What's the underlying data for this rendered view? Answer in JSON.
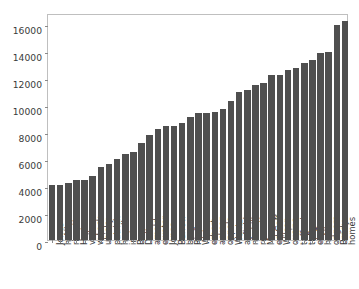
{
  "figure": {
    "background_color": "#ffffff",
    "axes_edge_color": "#bfbfbf",
    "bar_color": "#4f4f4f",
    "tick_color": "#3a3a3a"
  },
  "chart_data": {
    "type": "bar",
    "title": "",
    "xlabel": "",
    "ylabel": "",
    "ylim": [
      0,
      16800
    ],
    "yticks": [
      0,
      2000,
      4000,
      6000,
      8000,
      10000,
      12000,
      14000,
      16000
    ],
    "ytick_labels": [
      "0",
      "2000",
      "4000",
      "6000",
      "8000",
      "10000",
      "12000",
      "14000",
      "16000"
    ],
    "grid": false,
    "legend": false,
    "xtick_rotation": 90,
    "categories": [
      "Daniel Jones",
      "Josh Allen",
      "Jacoby Brissett",
      "Jalen Hurts",
      "Tua Tagovailoa",
      "Drew Lock",
      "Mitchell Trubisky",
      "Ryan Fitzpatrick",
      "Gardner Minshew II",
      "Jameis Winston",
      "Drew Brees",
      "Andy Dalton",
      "Sam Darnold",
      "Teddy Bridgewater",
      "Mac Jones",
      "Joe Burrow",
      "Ben Roethlisberger",
      "Philip Rivers",
      "Deshaun Watson",
      "Justin Herbert",
      "Lamar Jackson",
      "Jimmy Garoppolo",
      "Carson Wentz",
      "Baker Mayfield",
      "Ryan Tannehill",
      "Dak Prescott",
      "Kyler Murray",
      "Jared Goff",
      "Russell Wilson",
      "Kirk Cousins",
      "Matthew Stafford",
      "Matt Ryan",
      "Derek Carr",
      "Josh Allen",
      "Aaron Rodgers",
      "Tom Brady",
      "Patrick Mahomes"
    ],
    "xtick_labels": [
      "Jones",
      "h Allen",
      "rissett",
      "Hurts",
      "vailoa",
      "w Lock",
      "ubisky",
      "patrick",
      "hew II",
      "inston",
      "Brees",
      "Dalton",
      "arnold",
      "ewater",
      "Jones",
      "Burrow",
      "berger",
      "Rivers",
      "Watson",
      "erbert",
      "ackson",
      "oppolo",
      "Wentz",
      "ayfield",
      "nnehill",
      "rescott",
      "Murray",
      "ed Goff",
      "Wilson",
      "ousins",
      "tafford",
      "tt Ryan",
      "ek Carr",
      "h Allen",
      "odgers",
      "Brady",
      "homes"
    ],
    "values": [
      4038,
      4063,
      4234,
      4452,
      4464,
      4741,
      5432,
      5659,
      5993,
      6363,
      6529,
      7188,
      7767,
      8211,
      8456,
      8471,
      8664,
      9118,
      9375,
      9405,
      9494,
      9707,
      10253,
      10936,
      11103,
      11503,
      11634,
      12191,
      12206,
      12553,
      12729,
      13102,
      13332,
      13811,
      13899,
      15906,
      16215
    ]
  }
}
